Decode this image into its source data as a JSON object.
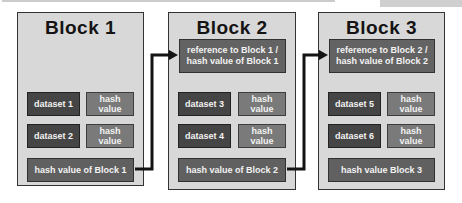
{
  "colors": {
    "block_fill": "#d8d8d8",
    "block_border": "#333333",
    "dataset_fill": "#454545",
    "hash_fill": "#7a7a7a",
    "ref_fill": "#636363",
    "footer_fill": "#606060",
    "text_light": "#f2f2f2",
    "arrow": "#141414"
  },
  "blocks": [
    {
      "title": "Block 1",
      "rows": [
        {
          "dataset": "dataset 1",
          "hash": "hash value"
        },
        {
          "dataset": "dataset 2",
          "hash": "hash value"
        }
      ],
      "footer": "hash value of Block 1"
    },
    {
      "title": "Block 2",
      "reference_lines": [
        "reference to Block 1 /",
        "hash value of Block 1"
      ],
      "rows": [
        {
          "dataset": "dataset 3",
          "hash": "hash value"
        },
        {
          "dataset": "dataset 4",
          "hash": "hash value"
        }
      ],
      "footer": "hash value of Block 2"
    },
    {
      "title": "Block 3",
      "reference_lines": [
        "reference to Block 2 /",
        "hash value of Block 2"
      ],
      "rows": [
        {
          "dataset": "dataset 5",
          "hash": "hash value"
        },
        {
          "dataset": "dataset 6",
          "hash": "hash value"
        }
      ],
      "footer": "hash value Block 3"
    }
  ]
}
